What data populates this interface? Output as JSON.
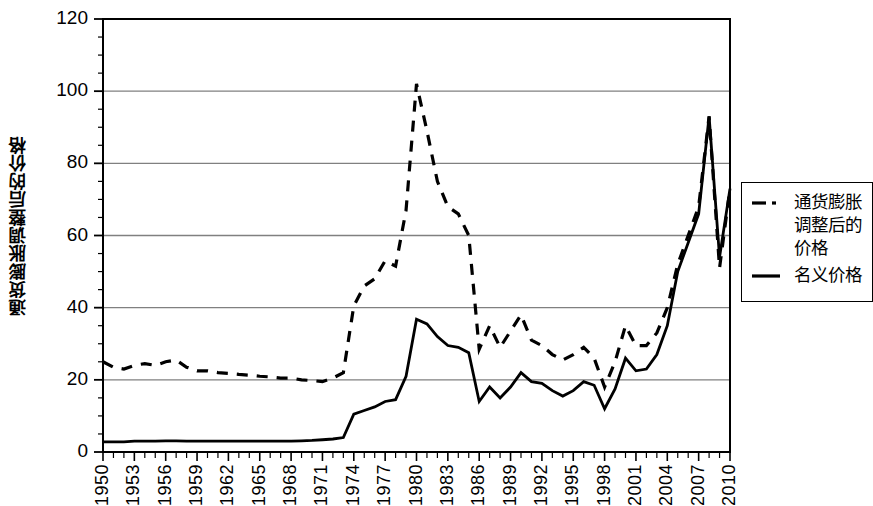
{
  "chart_data": {
    "type": "line",
    "title": "",
    "xlabel": "",
    "ylabel": "通货膨胀调整后的价格",
    "ylim": [
      0,
      120
    ],
    "xlim": [
      1950,
      2010
    ],
    "yticks": [
      0,
      20,
      40,
      60,
      80,
      100,
      120
    ],
    "xticks": [
      1950,
      1953,
      1956,
      1959,
      1962,
      1965,
      1968,
      1971,
      1974,
      1977,
      1980,
      1983,
      1986,
      1989,
      1992,
      1995,
      1998,
      2001,
      2004,
      2007,
      2010
    ],
    "grid": "horizontal",
    "legend_position": "right",
    "x": [
      1950,
      1951,
      1952,
      1953,
      1954,
      1955,
      1956,
      1957,
      1958,
      1959,
      1960,
      1961,
      1962,
      1963,
      1964,
      1965,
      1966,
      1967,
      1968,
      1969,
      1970,
      1971,
      1972,
      1973,
      1974,
      1975,
      1976,
      1977,
      1978,
      1979,
      1980,
      1981,
      1982,
      1983,
      1984,
      1985,
      1986,
      1987,
      1988,
      1989,
      1990,
      1991,
      1992,
      1993,
      1994,
      1995,
      1996,
      1997,
      1998,
      1999,
      2000,
      2001,
      2002,
      2003,
      2004,
      2005,
      2006,
      2007,
      2008,
      2009,
      2010
    ],
    "series": [
      {
        "name": "通货膨胀调整后的价格",
        "style": "dashed",
        "color": "#000000",
        "values": [
          25.0,
          23.5,
          23.0,
          24.0,
          24.5,
          24.0,
          25.0,
          25.5,
          23.5,
          22.5,
          22.5,
          22.0,
          21.8,
          21.5,
          21.3,
          21.0,
          20.8,
          20.5,
          20.5,
          20.0,
          19.8,
          19.5,
          20.5,
          22.0,
          40.5,
          46.0,
          48.0,
          53.0,
          51.5,
          67.0,
          102.0,
          89.0,
          75.0,
          68.0,
          66.0,
          60.0,
          28.5,
          35.0,
          29.0,
          33.5,
          38.0,
          31.0,
          29.5,
          27.0,
          25.5,
          27.0,
          29.0,
          26.0,
          18.0,
          25.0,
          35.0,
          29.5,
          29.5,
          33.0,
          40.0,
          52.0,
          60.0,
          68.0,
          93.0,
          51.0,
          73.0
        ]
      },
      {
        "name": "名义价格",
        "style": "solid",
        "color": "#000000",
        "values": [
          2.8,
          2.8,
          2.8,
          3.0,
          3.0,
          3.0,
          3.1,
          3.1,
          3.0,
          3.0,
          3.0,
          3.0,
          3.0,
          3.0,
          3.0,
          3.0,
          3.0,
          3.0,
          3.0,
          3.1,
          3.2,
          3.4,
          3.6,
          4.0,
          10.5,
          11.5,
          12.5,
          14.0,
          14.5,
          21.0,
          36.8,
          35.5,
          32.0,
          29.5,
          29.0,
          27.5,
          14.0,
          18.0,
          15.0,
          18.0,
          22.0,
          19.5,
          19.0,
          17.0,
          15.5,
          17.0,
          19.5,
          18.5,
          12.0,
          17.5,
          26.0,
          22.5,
          23.0,
          27.0,
          35.0,
          50.0,
          58.0,
          66.0,
          93.0,
          54.0,
          73.0
        ]
      }
    ]
  },
  "axes": {
    "ylabel": "通货膨胀调整后的价格",
    "ytick_labels": [
      "0",
      "20",
      "40",
      "60",
      "80",
      "100",
      "120"
    ],
    "xtick_labels": [
      "1950",
      "1953",
      "1956",
      "1959",
      "1962",
      "1965",
      "1968",
      "1971",
      "1974",
      "1977",
      "1980",
      "1983",
      "1986",
      "1989",
      "1992",
      "1995",
      "1998",
      "2001",
      "2004",
      "2007",
      "2010"
    ]
  },
  "legend": {
    "entries": [
      {
        "label": "通货膨胀调整后的\n价格",
        "style": "dashed"
      },
      {
        "label": "名义价格",
        "style": "solid"
      }
    ]
  },
  "colors": {
    "line": "#000000",
    "grid": "#808080",
    "axis": "#000000",
    "background": "#ffffff"
  }
}
